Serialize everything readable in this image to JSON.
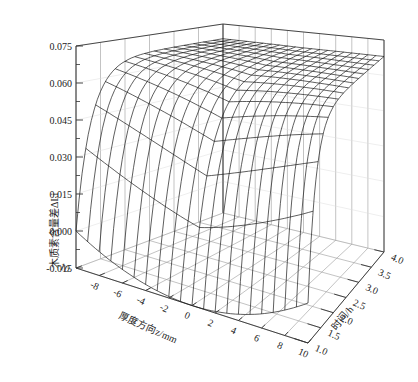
{
  "chart_data": {
    "type": "surface3d",
    "title": "",
    "zlabel": "木质素含量差ΔLi",
    "xlabel": "厚度方向z/mm",
    "ylabel": "时间/h",
    "x_ticks": [
      -10,
      -8,
      -6,
      -4,
      -2,
      0,
      2,
      4,
      6,
      8,
      10
    ],
    "x_tick_labels": [
      "-10",
      "-8",
      "-6",
      "-4",
      "-2",
      "0",
      "2",
      "4",
      "6",
      "8",
      "10"
    ],
    "y_ticks": [
      1.0,
      1.5,
      2.0,
      2.5,
      3.0,
      3.5,
      4.0
    ],
    "y_tick_labels": [
      "1.0",
      "1.5",
      "2.0",
      "2.5",
      "3.0",
      "3.5",
      "4.0"
    ],
    "z_ticks": [
      -0.015,
      0.0,
      0.015,
      0.03,
      0.045,
      0.06,
      0.075
    ],
    "z_tick_labels": [
      "-0.015",
      "0.000",
      "0.015",
      "0.030",
      "0.045",
      "0.060",
      "0.075"
    ],
    "xlim": [
      -10,
      10
    ],
    "ylim": [
      1.0,
      4.0
    ],
    "zlim": [
      -0.015,
      0.075
    ],
    "grid": true,
    "mesh": {
      "x_lines": 21,
      "y_lines": 16
    },
    "surface_description": "At t=1.0 h profile is bowl-shaped across thickness (≈0.000 at z=±10 mm, ≈-0.015 at center); values rise rapidly with time and plateau at ≈0.068 by t≈2.5–4.0 h.",
    "surface_samples": {
      "x": [
        -10,
        -5,
        0,
        5,
        10
      ],
      "t": [
        1.0,
        1.5,
        2.0,
        2.5,
        3.0,
        4.0
      ],
      "z": [
        [
          0.0,
          -0.01,
          -0.015,
          -0.01,
          0.0
        ],
        [
          0.045,
          0.035,
          0.03,
          0.035,
          0.045
        ],
        [
          0.062,
          0.058,
          0.055,
          0.058,
          0.062
        ],
        [
          0.066,
          0.065,
          0.064,
          0.065,
          0.066
        ],
        [
          0.067,
          0.067,
          0.066,
          0.067,
          0.067
        ],
        [
          0.068,
          0.068,
          0.068,
          0.068,
          0.068
        ]
      ]
    },
    "colors": {
      "mesh": "#1a1a1a",
      "grid": "#9a9a9a",
      "axis": "#333333",
      "background": "#ffffff"
    }
  }
}
